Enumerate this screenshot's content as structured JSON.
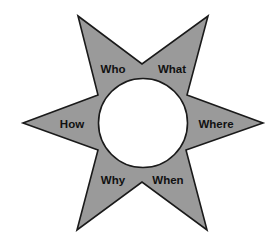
{
  "diagram": {
    "type": "six-point-star",
    "colors": {
      "star_fill": "#9a9a9a",
      "star_stroke": "#1a1a1a",
      "center_fill": "#ffffff",
      "label": "#111111",
      "background": "#ffffff"
    },
    "center": {
      "label": ""
    },
    "labels": [
      {
        "id": "who",
        "text": "Who"
      },
      {
        "id": "what",
        "text": "What"
      },
      {
        "id": "where",
        "text": "Where"
      },
      {
        "id": "when",
        "text": "When"
      },
      {
        "id": "why",
        "text": "Why"
      },
      {
        "id": "how",
        "text": "How"
      }
    ]
  }
}
